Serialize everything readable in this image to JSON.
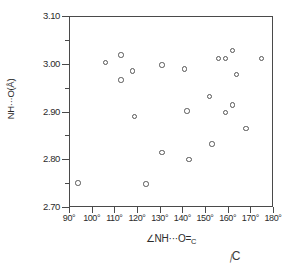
{
  "chart_data": {
    "type": "scatter",
    "title": "",
    "xlabel": "∠NH···O=C",
    "ylabel": "NH···O(Å)",
    "xlim": [
      90,
      180
    ],
    "ylim": [
      2.7,
      3.1
    ],
    "grid": false,
    "legend": null,
    "marker": "open-circle",
    "xtick_labels": [
      "90°",
      "100°",
      "110°",
      "120°",
      "130°",
      "140°",
      "150°",
      "160°",
      "170°",
      "180°"
    ],
    "xtick_values": [
      90,
      100,
      110,
      120,
      130,
      140,
      150,
      160,
      170,
      180
    ],
    "ytick_labels": [
      "3.10",
      "3.00",
      "2.90",
      "2.80",
      "2.70"
    ],
    "ytick_values": [
      3.1,
      3.0,
      2.9,
      2.8,
      2.7
    ],
    "y_minor_ticks": [
      3.05,
      2.95,
      2.85,
      2.75
    ],
    "points": [
      {
        "x": 94,
        "y": 2.75
      },
      {
        "x": 106,
        "y": 3.003
      },
      {
        "x": 113,
        "y": 3.018
      },
      {
        "x": 113,
        "y": 2.966
      },
      {
        "x": 118,
        "y": 2.985
      },
      {
        "x": 119,
        "y": 2.889
      },
      {
        "x": 124,
        "y": 2.748
      },
      {
        "x": 131,
        "y": 2.997
      },
      {
        "x": 131,
        "y": 2.814
      },
      {
        "x": 141,
        "y": 2.989
      },
      {
        "x": 142,
        "y": 2.901
      },
      {
        "x": 143,
        "y": 2.799
      },
      {
        "x": 152,
        "y": 2.931
      },
      {
        "x": 153,
        "y": 2.832
      },
      {
        "x": 156,
        "y": 3.011
      },
      {
        "x": 159,
        "y": 3.011
      },
      {
        "x": 159,
        "y": 2.898
      },
      {
        "x": 162,
        "y": 3.028
      },
      {
        "x": 162,
        "y": 2.914
      },
      {
        "x": 164,
        "y": 2.977
      },
      {
        "x": 168,
        "y": 2.864
      },
      {
        "x": 175,
        "y": 3.011
      }
    ]
  },
  "annotations": {
    "bottom_fragment": "C"
  }
}
